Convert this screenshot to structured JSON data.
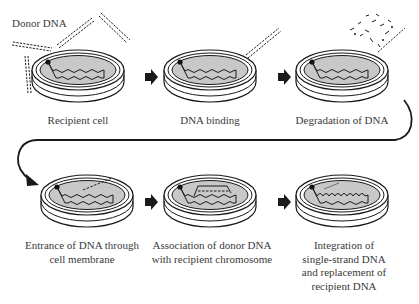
{
  "diagram": {
    "type": "process-flow",
    "topic": "bacterial transformation",
    "donor_label": "Donor DNA",
    "colors": {
      "line": "#1a1a1a",
      "dish_fill": "#ffffff",
      "agar_fill": "#c8c8c8",
      "text": "#3a3a3a"
    },
    "steps": [
      {
        "id": 1,
        "label": "Recipient cell",
        "lines": [
          "Recipient cell"
        ]
      },
      {
        "id": 2,
        "label": "DNA binding",
        "lines": [
          "DNA binding"
        ]
      },
      {
        "id": 3,
        "label": "Degradation of DNA",
        "lines": [
          "Degradation of DNA"
        ]
      },
      {
        "id": 4,
        "label": "Entrance of DNA through cell membrane",
        "lines": [
          "Entrance of DNA through",
          "cell membrane"
        ]
      },
      {
        "id": 5,
        "label": "Association of donor DNA with recipient chromosome",
        "lines": [
          "Association of donor DNA",
          "with recipient chromosome"
        ]
      },
      {
        "id": 6,
        "label": "Integration of single-strand DNA and replacement of recipient DNA",
        "lines": [
          "Integration of",
          "single-strand DNA",
          "and replacement of",
          "recipient DNA"
        ]
      }
    ],
    "arrows": [
      {
        "from": 1,
        "to": 2,
        "style": "block-arrow"
      },
      {
        "from": 2,
        "to": 3,
        "style": "block-arrow"
      },
      {
        "from": 3,
        "to": 4,
        "style": "curved-connector"
      },
      {
        "from": 4,
        "to": 5,
        "style": "block-arrow"
      },
      {
        "from": 5,
        "to": 6,
        "style": "block-arrow"
      }
    ]
  }
}
